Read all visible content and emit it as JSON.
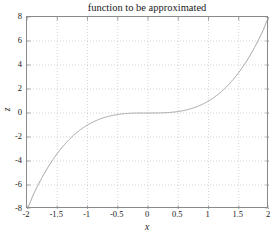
{
  "chart_data": {
    "type": "line",
    "title": "function to be approximated",
    "xlabel": "x",
    "ylabel": "z",
    "xlim": [
      -2,
      2
    ],
    "ylim": [
      -8,
      8
    ],
    "grid": true,
    "legend": null,
    "line_color": "#9a9a9a",
    "axis_color": "#8a8a8a",
    "grid_color": "#b8b8b8",
    "xticks": [
      -2,
      -1.5,
      -1,
      -0.5,
      0,
      0.5,
      1,
      1.5,
      2
    ],
    "xtick_labels": [
      "-2",
      "-1.5",
      "-1",
      "-0.5",
      "0",
      "0.5",
      "1",
      "1.5",
      "2"
    ],
    "yticks": [
      8,
      6,
      4,
      2,
      0,
      -2,
      -4,
      -6,
      -8
    ],
    "ytick_labels": [
      "8",
      "6",
      "4",
      "2",
      "0",
      "-2",
      "-4",
      "-6",
      "-8"
    ],
    "series": [
      {
        "name": "z = x^3",
        "x": [
          -2,
          -1.9,
          -1.8,
          -1.7,
          -1.6,
          -1.5,
          -1.4,
          -1.3,
          -1.2,
          -1.1,
          -1,
          -0.9,
          -0.8,
          -0.7,
          -0.6,
          -0.5,
          -0.4,
          -0.3,
          -0.2,
          -0.1,
          0,
          0.1,
          0.2,
          0.3,
          0.4,
          0.5,
          0.6,
          0.7,
          0.8,
          0.9,
          1,
          1.1,
          1.2,
          1.3,
          1.4,
          1.5,
          1.6,
          1.7,
          1.8,
          1.9,
          2
        ],
        "y": [
          -8,
          -6.859,
          -5.832,
          -4.913,
          -4.096,
          -3.375,
          -2.744,
          -2.197,
          -1.728,
          -1.331,
          -1,
          -0.729,
          -0.512,
          -0.343,
          -0.216,
          -0.125,
          -0.064,
          -0.027,
          -0.008,
          -0.001,
          0,
          0.001,
          0.008,
          0.027,
          0.064,
          0.125,
          0.216,
          0.343,
          0.512,
          0.729,
          1,
          1.331,
          1.728,
          2.197,
          2.744,
          3.375,
          4.096,
          4.913,
          5.832,
          6.859,
          8
        ]
      }
    ]
  }
}
